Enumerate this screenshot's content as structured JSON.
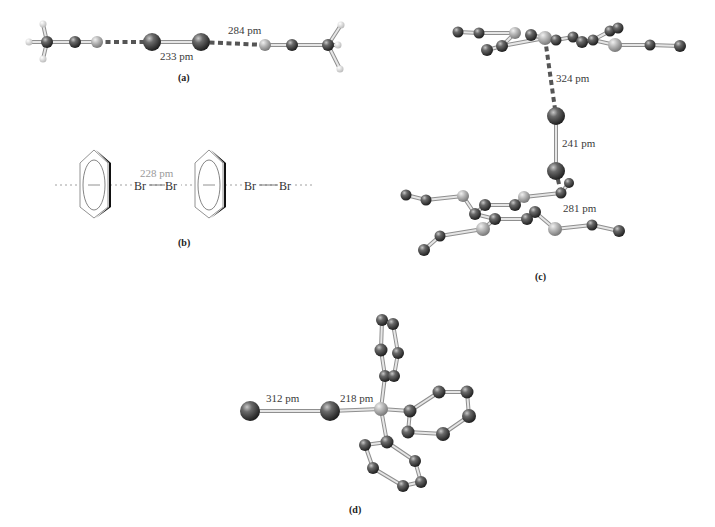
{
  "figure": {
    "panels": [
      {
        "id": "a",
        "label": "(a)",
        "label_pos": [
          186,
          78
        ],
        "distances": [
          {
            "text": "233 pm",
            "pos": [
              176,
              60
            ]
          },
          {
            "text": "284 pm",
            "pos": [
              245,
              34
            ]
          }
        ],
        "atoms": [
          {
            "x": 47,
            "y": 42,
            "r": 6,
            "type": "C"
          },
          {
            "x": 75,
            "y": 42,
            "r": 6,
            "type": "C"
          },
          {
            "x": 97,
            "y": 42,
            "r": 6,
            "type": "N"
          },
          {
            "x": 152,
            "y": 42,
            "r": 9,
            "type": "Br"
          },
          {
            "x": 201,
            "y": 42,
            "r": 9,
            "type": "Br"
          },
          {
            "x": 265,
            "y": 45,
            "r": 6,
            "type": "N"
          },
          {
            "x": 292,
            "y": 45,
            "r": 6,
            "type": "C"
          },
          {
            "x": 328,
            "y": 45,
            "r": 6,
            "type": "C"
          },
          {
            "x": 29,
            "y": 42,
            "r": 3.5,
            "type": "H"
          },
          {
            "x": 43,
            "y": 24,
            "r": 3.5,
            "type": "H"
          },
          {
            "x": 43,
            "y": 59,
            "r": 3.5,
            "type": "H"
          },
          {
            "x": 341,
            "y": 25,
            "r": 3.5,
            "type": "H"
          },
          {
            "x": 338,
            "y": 45,
            "r": 3.5,
            "type": "H"
          },
          {
            "x": 340,
            "y": 69,
            "r": 3.5,
            "type": "H"
          }
        ],
        "bonds": [
          [
            0,
            1
          ],
          [
            1,
            2
          ],
          [
            3,
            4
          ],
          [
            5,
            6
          ],
          [
            6,
            7
          ],
          [
            0,
            8
          ],
          [
            0,
            9
          ],
          [
            0,
            10
          ],
          [
            7,
            11
          ],
          [
            7,
            12
          ],
          [
            7,
            13
          ]
        ],
        "halogen_bonds": [
          [
            2,
            3
          ],
          [
            4,
            5
          ]
        ]
      },
      {
        "id": "b",
        "label": "(b)",
        "label_pos": [
          186,
          243
        ],
        "distance": {
          "text": "228 pm",
          "pos": [
            140,
            178
          ]
        },
        "atoms_text": [
          {
            "text": "Br",
            "pos": [
              143,
              190
            ]
          },
          {
            "text": "Br",
            "pos": [
              172,
              190
            ]
          },
          {
            "text": "Br",
            "pos": [
              251,
              190
            ]
          },
          {
            "text": "Br",
            "pos": [
              286,
              190
            ]
          }
        ],
        "rings": [
          {
            "cx": 94,
            "cy": 185
          },
          {
            "cx": 209,
            "cy": 185
          }
        ]
      },
      {
        "id": "c",
        "label": "(c)",
        "label_pos": [
          543,
          278
        ],
        "distances": [
          {
            "text": "324 pm",
            "pos": [
              558,
              82
            ]
          },
          {
            "text": "241 pm",
            "pos": [
              562,
              146
            ]
          },
          {
            "text": "281 pm",
            "pos": [
              563,
              210
            ]
          }
        ],
        "atoms": [
          {
            "x": 458,
            "y": 32,
            "r": 5.5,
            "type": "C"
          },
          {
            "x": 479,
            "y": 33,
            "r": 5.5,
            "type": "C"
          },
          {
            "x": 515,
            "y": 33,
            "r": 6,
            "type": "S"
          },
          {
            "x": 487,
            "y": 50,
            "r": 6,
            "type": "C"
          },
          {
            "x": 502,
            "y": 46,
            "r": 6,
            "type": "C"
          },
          {
            "x": 531,
            "y": 35,
            "r": 6,
            "type": "C"
          },
          {
            "x": 545,
            "y": 38,
            "r": 7,
            "type": "S"
          },
          {
            "x": 556,
            "y": 40,
            "r": 5.5,
            "type": "C"
          },
          {
            "x": 573,
            "y": 37,
            "r": 5.5,
            "type": "C"
          },
          {
            "x": 582,
            "y": 42,
            "r": 6,
            "type": "C"
          },
          {
            "x": 593,
            "y": 40,
            "r": 5.5,
            "type": "C"
          },
          {
            "x": 610,
            "y": 31,
            "r": 5.5,
            "type": "C"
          },
          {
            "x": 618,
            "y": 28,
            "r": 5.5,
            "type": "C"
          },
          {
            "x": 615,
            "y": 45,
            "r": 7,
            "type": "S"
          },
          {
            "x": 650,
            "y": 45,
            "r": 5.5,
            "type": "C"
          },
          {
            "x": 680,
            "y": 46,
            "r": 6,
            "type": "C"
          },
          {
            "x": 556,
            "y": 116,
            "r": 9,
            "type": "Br"
          },
          {
            "x": 556,
            "y": 171,
            "r": 9,
            "type": "Br"
          },
          {
            "x": 406,
            "y": 195,
            "r": 5.5,
            "type": "C"
          },
          {
            "x": 426,
            "y": 200,
            "r": 5.5,
            "type": "C"
          },
          {
            "x": 463,
            "y": 196,
            "r": 6,
            "type": "S"
          },
          {
            "x": 485,
            "y": 205,
            "r": 6,
            "type": "C"
          },
          {
            "x": 475,
            "y": 214,
            "r": 6,
            "type": "C"
          },
          {
            "x": 495,
            "y": 219,
            "r": 6,
            "type": "C"
          },
          {
            "x": 515,
            "y": 205,
            "r": 6,
            "type": "C"
          },
          {
            "x": 524,
            "y": 197,
            "r": 6,
            "type": "S"
          },
          {
            "x": 535,
            "y": 212,
            "r": 6,
            "type": "C"
          },
          {
            "x": 527,
            "y": 219,
            "r": 6,
            "type": "C"
          },
          {
            "x": 561,
            "y": 193,
            "r": 5.5,
            "type": "C"
          },
          {
            "x": 569,
            "y": 183,
            "r": 5,
            "type": "C"
          },
          {
            "x": 483,
            "y": 229,
            "r": 7,
            "type": "S"
          },
          {
            "x": 555,
            "y": 229,
            "r": 7,
            "type": "S"
          },
          {
            "x": 440,
            "y": 236,
            "r": 5.5,
            "type": "C"
          },
          {
            "x": 424,
            "y": 250,
            "r": 6,
            "type": "C"
          },
          {
            "x": 592,
            "y": 225,
            "r": 5.5,
            "type": "C"
          },
          {
            "x": 619,
            "y": 231,
            "r": 6,
            "type": "C"
          }
        ],
        "bonds": [
          [
            0,
            1
          ],
          [
            1,
            2
          ],
          [
            2,
            4
          ],
          [
            3,
            4
          ],
          [
            4,
            6
          ],
          [
            6,
            7
          ],
          [
            7,
            8
          ],
          [
            8,
            9
          ],
          [
            9,
            10
          ],
          [
            10,
            11
          ],
          [
            11,
            12
          ],
          [
            10,
            13
          ],
          [
            13,
            14
          ],
          [
            14,
            15
          ],
          [
            5,
            6
          ],
          [
            16,
            17
          ],
          [
            18,
            19
          ],
          [
            19,
            20
          ],
          [
            20,
            22
          ],
          [
            21,
            22
          ],
          [
            22,
            23
          ],
          [
            23,
            27
          ],
          [
            21,
            24
          ],
          [
            24,
            25
          ],
          [
            25,
            28
          ],
          [
            27,
            26
          ],
          [
            26,
            31
          ],
          [
            31,
            34
          ],
          [
            34,
            35
          ],
          [
            23,
            30
          ],
          [
            30,
            32
          ],
          [
            32,
            33
          ],
          [
            28,
            29
          ]
        ],
        "halogen_bonds": [
          [
            6,
            16
          ],
          [
            17,
            28
          ]
        ]
      },
      {
        "id": "d",
        "label": "(d)",
        "label_pos": [
          357,
          511
        ],
        "distances": [
          {
            "text": "312 pm",
            "pos": [
              276,
              403
            ]
          },
          {
            "text": "218 pm",
            "pos": [
              340,
              403
            ]
          }
        ],
        "atoms": [
          {
            "x": 250,
            "y": 411,
            "r": 10,
            "type": "Br"
          },
          {
            "x": 330,
            "y": 411,
            "r": 10,
            "type": "Br"
          },
          {
            "x": 381,
            "y": 409,
            "r": 7,
            "type": "P"
          },
          {
            "x": 410,
            "y": 411,
            "r": 6.5,
            "type": "C"
          },
          {
            "x": 439,
            "y": 392,
            "r": 6.5,
            "type": "C"
          },
          {
            "x": 467,
            "y": 392,
            "r": 6.5,
            "type": "C"
          },
          {
            "x": 469,
            "y": 416,
            "r": 7,
            "type": "C"
          },
          {
            "x": 443,
            "y": 434,
            "r": 7,
            "type": "C"
          },
          {
            "x": 408,
            "y": 432,
            "r": 6.5,
            "type": "C"
          },
          {
            "x": 385,
            "y": 376,
            "r": 6,
            "type": "C"
          },
          {
            "x": 394,
            "y": 376,
            "r": 6,
            "type": "C"
          },
          {
            "x": 381,
            "y": 350,
            "r": 6.5,
            "type": "C"
          },
          {
            "x": 398,
            "y": 353,
            "r": 6,
            "type": "C"
          },
          {
            "x": 382,
            "y": 320,
            "r": 6,
            "type": "C"
          },
          {
            "x": 393,
            "y": 324,
            "r": 6,
            "type": "C"
          },
          {
            "x": 387,
            "y": 442,
            "r": 6.5,
            "type": "C"
          },
          {
            "x": 365,
            "y": 445,
            "r": 6,
            "type": "C"
          },
          {
            "x": 373,
            "y": 468,
            "r": 6,
            "type": "C"
          },
          {
            "x": 415,
            "y": 461,
            "r": 6,
            "type": "C"
          },
          {
            "x": 403,
            "y": 486,
            "r": 6,
            "type": "C"
          },
          {
            "x": 421,
            "y": 482,
            "r": 6,
            "type": "C"
          }
        ],
        "bonds": [
          [
            0,
            1
          ],
          [
            1,
            2
          ],
          [
            2,
            3
          ],
          [
            3,
            4
          ],
          [
            4,
            5
          ],
          [
            5,
            6
          ],
          [
            6,
            7
          ],
          [
            7,
            8
          ],
          [
            8,
            3
          ],
          [
            2,
            9
          ],
          [
            9,
            11
          ],
          [
            11,
            13
          ],
          [
            13,
            14
          ],
          [
            14,
            12
          ],
          [
            12,
            10
          ],
          [
            10,
            9
          ],
          [
            2,
            15
          ],
          [
            15,
            16
          ],
          [
            16,
            17
          ],
          [
            17,
            19
          ],
          [
            19,
            20
          ],
          [
            20,
            18
          ],
          [
            18,
            15
          ]
        ],
        "halogen_bonds": []
      }
    ]
  },
  "colors": {
    "atom_dark": "#4a4a4a",
    "atom_light": "#b8b8b8",
    "bond": "#c8c8c8",
    "hbond_dash": "#555555",
    "text": "#3a3a3a",
    "text_light": "#9a9a9a"
  }
}
